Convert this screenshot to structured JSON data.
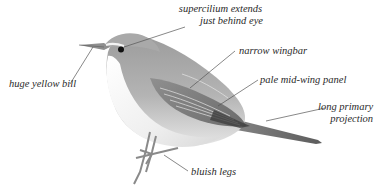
{
  "figure": {
    "colors": {
      "background": "#ffffff",
      "label_text": "#2a2a2a",
      "leader_line": "#555555",
      "plumage_upper": "#a6a6a6",
      "plumage_under": "#f2f2f2",
      "eye": "#111111"
    },
    "labels": [
      {
        "id": "supercilium",
        "line1": "supercilium extends",
        "line2": "just behind eye"
      },
      {
        "id": "bill",
        "line1": "huge yellow bill"
      },
      {
        "id": "wingbar",
        "line1": "narrow wingbar"
      },
      {
        "id": "wing-panel",
        "line1": "pale mid-wing panel"
      },
      {
        "id": "primary-projection",
        "line1": "long primary",
        "line2": "projection"
      },
      {
        "id": "legs",
        "line1": "bluish legs"
      }
    ]
  }
}
